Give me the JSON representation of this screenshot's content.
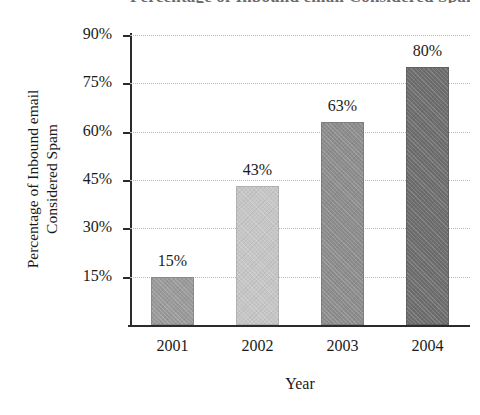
{
  "chart_data": {
    "type": "bar",
    "title": "Percentage of Inbound email Considered Spam",
    "xlabel": "Year",
    "ylabel_line1": "Percentage of Inbound email",
    "ylabel_line2": "Considered Spam",
    "categories": [
      "2001",
      "2002",
      "2003",
      "2004"
    ],
    "values": [
      15,
      43,
      63,
      80
    ],
    "data_labels": [
      "15%",
      "43%",
      "63%",
      "80%"
    ],
    "ytick_labels": [
      "90%",
      "75%",
      "60%",
      "45%",
      "30%",
      "15%"
    ],
    "ytick_values": [
      90,
      75,
      60,
      45,
      30,
      15
    ],
    "ylim": [
      0,
      90
    ],
    "grid": true,
    "grid_style": "dotted",
    "legend": "none",
    "bar_colors": [
      "#9a9a9a",
      "#c6c6c6",
      "#8d8d8d",
      "#6e6e6e"
    ],
    "axis_color": "#2b2b2b",
    "grid_color": "#b9b9b9"
  }
}
